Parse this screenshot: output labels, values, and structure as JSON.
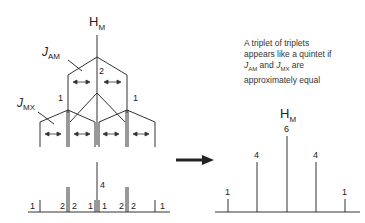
{
  "left_tree": {
    "top_label": "H",
    "top_label_sub": "M",
    "j_am_label": "J",
    "j_am_sub": "AM",
    "j_mx_label": "J",
    "j_mx_sub": "MX",
    "level1_center_intensity": "2",
    "level1_side_intensities": [
      "1",
      "1"
    ],
    "stick_center_intensity": "4",
    "stick_intensities": [
      "1",
      "2",
      "2",
      "1",
      "1",
      "2",
      "2",
      "1"
    ]
  },
  "note": {
    "line1": "A triplet of triplets",
    "line2": "appears like a quintet if",
    "j_am": "J",
    "j_am_sub": "AM",
    "and": " and ",
    "j_mx": "J",
    "j_mx_sub": "MX",
    "are": " are",
    "line4": "approximately equal"
  },
  "right_spectrum": {
    "label": "H",
    "label_sub": "M",
    "intensities": [
      "1",
      "4",
      "6",
      "4",
      "1"
    ]
  },
  "arrow": "right-arrow"
}
